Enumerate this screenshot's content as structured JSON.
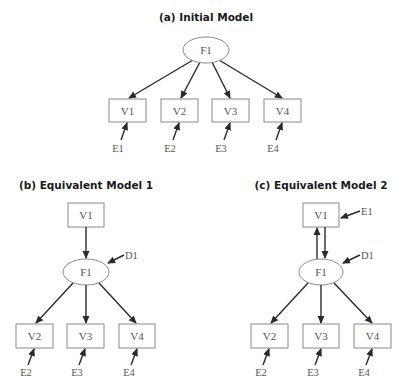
{
  "panels": {
    "a": {
      "title": "(a) Initial Model",
      "factor": "F1",
      "indicators": [
        "V1",
        "V2",
        "V3",
        "V4"
      ],
      "errors": [
        "E1",
        "E2",
        "E3",
        "E4"
      ]
    },
    "b": {
      "title": "(b) Equivalent Model 1",
      "cause": "V1",
      "factor": "F1",
      "disturbance": "D1",
      "indicators": [
        "V2",
        "V3",
        "V4"
      ],
      "errors": [
        "E2",
        "E3",
        "E4"
      ]
    },
    "c": {
      "title": "(c) Equivalent Model 2",
      "reciprocal": "V1",
      "reciprocal_error": "E1",
      "factor": "F1",
      "disturbance": "D1",
      "indicators": [
        "V2",
        "V3",
        "V4"
      ],
      "errors": [
        "E2",
        "E3",
        "E4"
      ]
    }
  },
  "colors": {
    "edge": "#2a2a2a",
    "shape_stroke": "#8a8a8a",
    "label": "#555555",
    "title": "#1a1a1a"
  }
}
